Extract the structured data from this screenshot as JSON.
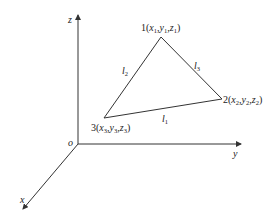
{
  "diagram": {
    "axes": {
      "origin_label": "o",
      "x_label": "x",
      "y_label": "y",
      "z_label": "z"
    },
    "vertices": [
      {
        "id": "1",
        "num": "1",
        "var": "x",
        "var2": "y",
        "var3": "z",
        "sub": "1"
      },
      {
        "id": "2",
        "num": "2",
        "var": "x",
        "var2": "y",
        "var3": "z",
        "sub": "2"
      },
      {
        "id": "3",
        "num": "3",
        "var": "x",
        "var2": "y",
        "var3": "z",
        "sub": "3"
      }
    ],
    "edges": [
      {
        "name": "l",
        "sub": "1",
        "between": "2-3"
      },
      {
        "name": "l",
        "sub": "2",
        "between": "1-3"
      },
      {
        "name": "l",
        "sub": "3",
        "between": "1-2"
      }
    ],
    "colors": {
      "line": "#333333",
      "background": "#ffffff"
    }
  }
}
